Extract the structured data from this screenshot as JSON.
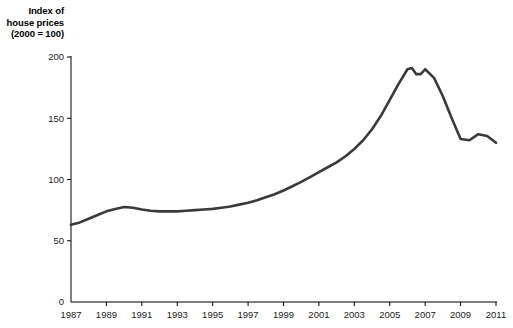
{
  "chart_data": {
    "type": "line",
    "title": "Index of house prices (2000 = 100)",
    "title_lines": [
      "Index of",
      "house prices",
      "(2000 = 100)"
    ],
    "xlabel": "",
    "ylabel": "Index of house prices (2000 = 100)",
    "xlim": [
      1987,
      2011
    ],
    "ylim": [
      0,
      200
    ],
    "grid": false,
    "legend": false,
    "line_color": "#3a3a3a",
    "axis_color": "#000000",
    "yticks": [
      0,
      50,
      100,
      150,
      200
    ],
    "ytick_labels": [
      "0",
      "50",
      "100",
      "150",
      "200"
    ],
    "xticks": [
      1987,
      1989,
      1991,
      1993,
      1995,
      1997,
      1999,
      2001,
      2003,
      2005,
      2007,
      2009,
      2011
    ],
    "xtick_labels": [
      "1987",
      "1989",
      "1991",
      "1993",
      "1995",
      "1997",
      "1999",
      "2001",
      "2003",
      "2005",
      "2007",
      "2009",
      "2011"
    ],
    "x": [
      1987,
      1987.5,
      1988,
      1988.5,
      1989,
      1989.5,
      1990,
      1990.5,
      1991,
      1991.5,
      1992,
      1992.5,
      1993,
      1993.5,
      1994,
      1994.5,
      1995,
      1995.5,
      1996,
      1996.5,
      1997,
      1997.5,
      1998,
      1998.5,
      1999,
      1999.5,
      2000,
      2000.5,
      2001,
      2001.5,
      2002,
      2002.5,
      2003,
      2003.5,
      2004,
      2004.5,
      2005,
      2005.5,
      2006,
      2006.25,
      2006.5,
      2006.75,
      2007,
      2007.5,
      2008,
      2008.5,
      2009,
      2009.5,
      2010,
      2010.5,
      2011
    ],
    "values": [
      63,
      65,
      68,
      71,
      74,
      76,
      77.5,
      77,
      75.5,
      74.5,
      74,
      74,
      74,
      74.5,
      75,
      75.5,
      76,
      77,
      78,
      79.5,
      81,
      83,
      85.5,
      88,
      91,
      94.5,
      98,
      102,
      106,
      110,
      114,
      119,
      125,
      132,
      141,
      152,
      165,
      178,
      190,
      191,
      186,
      186,
      190,
      183,
      168,
      150,
      133,
      132,
      137,
      135.5,
      130
    ],
    "series": [
      {
        "name": "House price index",
        "values": [
          63,
          65,
          68,
          71,
          74,
          76,
          77.5,
          77,
          75.5,
          74.5,
          74,
          74,
          74,
          74.5,
          75,
          75.5,
          76,
          77,
          78,
          79.5,
          81,
          83,
          85.5,
          88,
          91,
          94.5,
          98,
          102,
          106,
          110,
          114,
          119,
          125,
          132,
          141,
          152,
          165,
          178,
          190,
          191,
          186,
          186,
          190,
          183,
          168,
          150,
          133,
          132,
          137,
          135.5,
          130
        ]
      }
    ],
    "annotations": []
  },
  "layout": {
    "plot_left": 71,
    "plot_right": 496,
    "plot_top": 57,
    "plot_bottom": 302
  }
}
